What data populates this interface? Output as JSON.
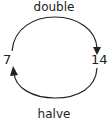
{
  "diagram": {
    "top_operation": "double",
    "bottom_operation": "halve",
    "left_value": "7",
    "right_value": "14",
    "colors": {
      "stroke": "#222222",
      "background": "#ffffff"
    }
  }
}
